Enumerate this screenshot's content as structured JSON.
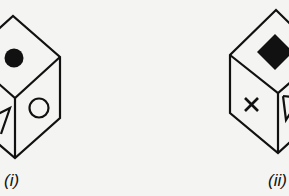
{
  "figure": {
    "background": "#f4f4f2",
    "stroke_color": "#111111",
    "cubes": [
      {
        "id": "i",
        "label": "(i)",
        "faces": {
          "top": "filled-circle",
          "front_left": "triangle",
          "front_right": "open-circle"
        }
      },
      {
        "id": "ii",
        "label": "(ii)",
        "faces": {
          "top": "filled-diamond",
          "front_left": "cross",
          "front_right": "triangle"
        }
      }
    ]
  }
}
